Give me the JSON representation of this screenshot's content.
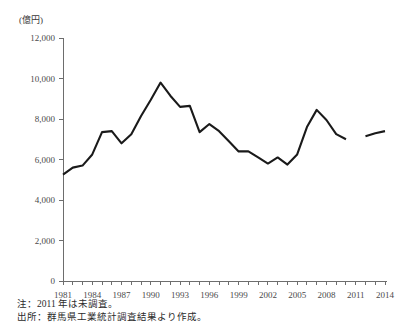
{
  "unit_label": "(億円)",
  "notes": {
    "note": "注：2011 年は未調査。",
    "source": "出所：群馬県工業統計調査結果より作成。"
  },
  "axis": {
    "y_ticks": [
      "0",
      "2,000",
      "4,000",
      "6,000",
      "8,000",
      "10,000",
      "12,000"
    ],
    "x_ticks": [
      "1981",
      "1984",
      "1987",
      "1990",
      "1993",
      "1996",
      "1999",
      "2002",
      "2005",
      "2008",
      "2011",
      "2014"
    ]
  },
  "chart_data": {
    "type": "line",
    "title": "",
    "xlabel": "",
    "ylabel": "(億円)",
    "ylim": [
      0,
      12000
    ],
    "ytick_values": [
      0,
      2000,
      4000,
      6000,
      8000,
      10000,
      12000
    ],
    "grid": false,
    "legend": "none",
    "line_color": "#1a1a1a",
    "x": [
      1981,
      1982,
      1983,
      1984,
      1985,
      1986,
      1987,
      1988,
      1989,
      1990,
      1991,
      1992,
      1993,
      1994,
      1995,
      1996,
      1997,
      1998,
      1999,
      2000,
      2001,
      2002,
      2003,
      2004,
      2005,
      2006,
      2007,
      2008,
      2009,
      2010,
      2011,
      2012,
      2013,
      2014
    ],
    "values": [
      5250,
      5600,
      5700,
      6250,
      7350,
      7400,
      6800,
      7250,
      8150,
      8950,
      9800,
      9150,
      8600,
      8650,
      7350,
      7750,
      7400,
      6900,
      6400,
      6400,
      6100,
      5800,
      6100,
      5750,
      6250,
      7600,
      8450,
      7950,
      7250,
      7000,
      null,
      7150,
      7300,
      7400
    ],
    "annotations": [
      "2011 年は未調査（データ欠損）"
    ],
    "x_tick_labels": [
      "1981",
      "1984",
      "1987",
      "1990",
      "1993",
      "1996",
      "1999",
      "2002",
      "2005",
      "2008",
      "2011",
      "2014"
    ],
    "x_tick_years": [
      1981,
      1984,
      1987,
      1990,
      1993,
      1996,
      1999,
      2002,
      2005,
      2008,
      2011,
      2014
    ],
    "x_range": [
      1981,
      2014
    ]
  }
}
